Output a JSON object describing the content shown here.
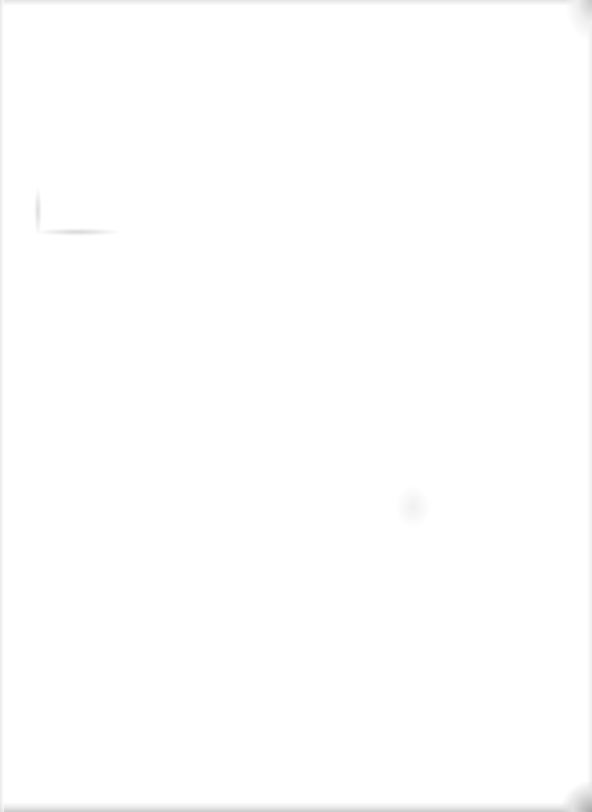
{
  "document": {
    "type": "scanned-page",
    "content": "",
    "state": "blank"
  }
}
